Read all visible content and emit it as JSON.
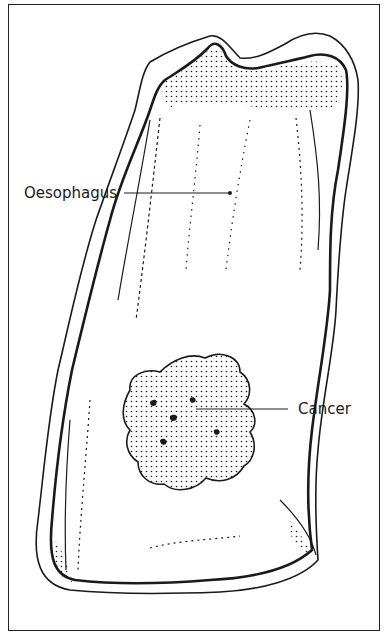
{
  "diagram": {
    "labels": [
      {
        "id": "oesophagus",
        "text": "Oesophagus"
      },
      {
        "id": "cancer",
        "text": "Cancer"
      }
    ],
    "colors": {
      "ink": "#1a1a1a",
      "background": "#ffffff"
    }
  }
}
